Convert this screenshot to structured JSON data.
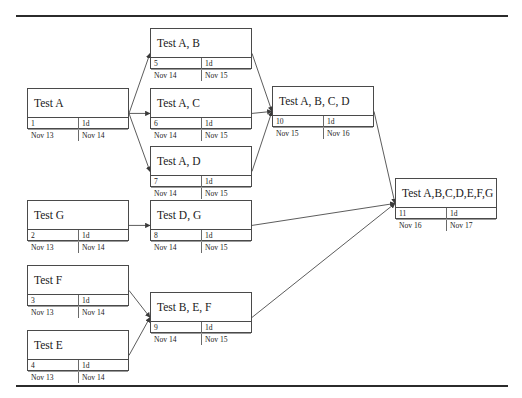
{
  "diagram": {
    "type": "pert-network",
    "canvas": {
      "width": 522,
      "height": 398
    },
    "columns": {
      "headers": [
        "id",
        "duration",
        "start",
        "finish"
      ]
    },
    "rules": {
      "top_label": "top-divider",
      "bottom_label": "bottom-divider"
    },
    "nodes": [
      {
        "key": "test-a",
        "name": "Test A",
        "id": "1",
        "duration": "1d",
        "start": "Nov 13",
        "finish": "Nov 14",
        "x": 27,
        "y": 88,
        "w": 102,
        "h": 41
      },
      {
        "key": "test-a-b",
        "name": "Test A, B",
        "id": "5",
        "duration": "1d",
        "start": "Nov 14",
        "finish": "Nov 15",
        "x": 150,
        "y": 28,
        "w": 102,
        "h": 41
      },
      {
        "key": "test-a-c",
        "name": "Test A, C",
        "id": "6",
        "duration": "1d",
        "start": "Nov 14",
        "finish": "Nov 15",
        "x": 150,
        "y": 88,
        "w": 102,
        "h": 41
      },
      {
        "key": "test-a-d",
        "name": "Test A, D",
        "id": "7",
        "duration": "1d",
        "start": "Nov 14",
        "finish": "Nov 15",
        "x": 150,
        "y": 146,
        "w": 102,
        "h": 41
      },
      {
        "key": "test-a-b-c-d",
        "name": "Test A, B, C, D",
        "id": "10",
        "duration": "1d",
        "start": "Nov 15",
        "finish": "Nov 16",
        "x": 272,
        "y": 86,
        "w": 102,
        "h": 41
      },
      {
        "key": "test-g",
        "name": "Test G",
        "id": "2",
        "duration": "1d",
        "start": "Nov 13",
        "finish": "Nov 14",
        "x": 27,
        "y": 200,
        "w": 102,
        "h": 41
      },
      {
        "key": "test-d-g",
        "name": "Test D, G",
        "id": "8",
        "duration": "1d",
        "start": "Nov 14",
        "finish": "Nov 15",
        "x": 150,
        "y": 200,
        "w": 102,
        "h": 41
      },
      {
        "key": "test-f",
        "name": "Test F",
        "id": "3",
        "duration": "1d",
        "start": "Nov 13",
        "finish": "Nov 14",
        "x": 27,
        "y": 265,
        "w": 102,
        "h": 41
      },
      {
        "key": "test-e",
        "name": "Test E",
        "id": "4",
        "duration": "1d",
        "start": "Nov 13",
        "finish": "Nov 14",
        "x": 27,
        "y": 330,
        "w": 102,
        "h": 41
      },
      {
        "key": "test-b-e-f",
        "name": "Test B, E, F",
        "id": "9",
        "duration": "1d",
        "start": "Nov 14",
        "finish": "Nov 15",
        "x": 150,
        "y": 292,
        "w": 102,
        "h": 41
      },
      {
        "key": "test-all",
        "name": "Test A,B,C,D,E,F,G",
        "id": "11",
        "duration": "1d",
        "start": "Nov 16",
        "finish": "Nov 17",
        "x": 395,
        "y": 178,
        "w": 102,
        "h": 41
      }
    ],
    "edges": [
      {
        "from": "test-a",
        "to": "test-a-b"
      },
      {
        "from": "test-a",
        "to": "test-a-c"
      },
      {
        "from": "test-a",
        "to": "test-a-d"
      },
      {
        "from": "test-a-b",
        "to": "test-a-b-c-d"
      },
      {
        "from": "test-a-c",
        "to": "test-a-b-c-d"
      },
      {
        "from": "test-a-d",
        "to": "test-a-b-c-d"
      },
      {
        "from": "test-g",
        "to": "test-d-g"
      },
      {
        "from": "test-f",
        "to": "test-b-e-f"
      },
      {
        "from": "test-e",
        "to": "test-b-e-f"
      },
      {
        "from": "test-a-b-c-d",
        "to": "test-all"
      },
      {
        "from": "test-d-g",
        "to": "test-all"
      },
      {
        "from": "test-b-e-f",
        "to": "test-all"
      }
    ],
    "colors": {
      "line": "#4a4a4a",
      "rule": "#2b2b2b",
      "background": "#ffffff",
      "text": "#1a1a1a"
    }
  }
}
